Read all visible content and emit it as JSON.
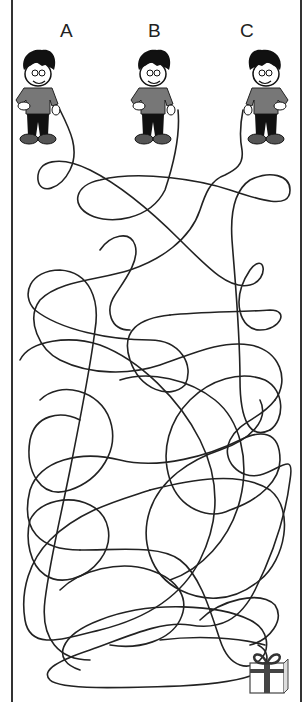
{
  "puzzle": {
    "type": "tangled-lines-maze",
    "characters": [
      {
        "label": "A",
        "x": 40
      },
      {
        "label": "B",
        "x": 155
      },
      {
        "label": "C",
        "x": 248
      }
    ],
    "goal": "gift-box",
    "colors": {
      "line": "#222222",
      "shirt": "#777777",
      "pants": "#111111",
      "hair": "#111111",
      "gift_ribbon": "#444444"
    }
  }
}
